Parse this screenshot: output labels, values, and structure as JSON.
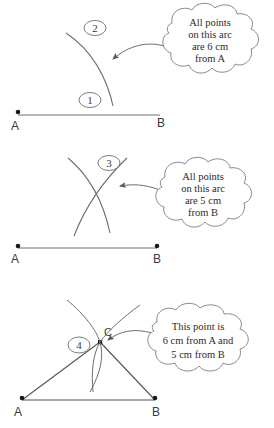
{
  "figure": {
    "background_color": "#ffffff",
    "ink_color": "#555555",
    "text_color": "#2b2b2b"
  },
  "panels": [
    {
      "id": "panel-1",
      "step_labels": [
        "1",
        "2"
      ],
      "point_labels": [
        "A",
        "B"
      ],
      "callout_lines": [
        "All points",
        "on this arc",
        "are 6 cm",
        "from A"
      ]
    },
    {
      "id": "panel-2",
      "step_labels": [
        "3"
      ],
      "point_labels": [
        "A",
        "B"
      ],
      "callout_lines": [
        "All points",
        "on this arc",
        "are 5 cm",
        "from B"
      ]
    },
    {
      "id": "panel-3",
      "step_labels": [
        "4"
      ],
      "point_labels": [
        "A",
        "B",
        "C"
      ],
      "callout_lines": [
        "This point is",
        "6 cm from A and",
        "5 cm from B"
      ]
    }
  ]
}
